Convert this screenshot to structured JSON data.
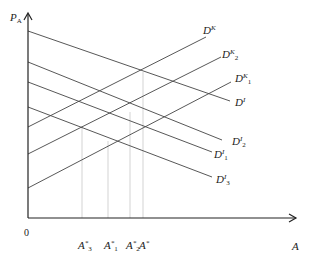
{
  "axes": {
    "y_label": {
      "base": "P",
      "sub": "A"
    },
    "x_label": "A",
    "origin": "0"
  },
  "curves": [
    {
      "id": "DI",
      "base": "D",
      "sup": "I",
      "sub": "",
      "x1": 28,
      "y1": 31,
      "x2": 230,
      "y2": 101,
      "lx": 235,
      "ly": 97
    },
    {
      "id": "DI2",
      "base": "D",
      "sup": "I",
      "sub": "2",
      "x1": 28,
      "y1": 62,
      "x2": 222,
      "y2": 140,
      "lx": 232,
      "ly": 136
    },
    {
      "id": "DI1",
      "base": "D",
      "sup": "I",
      "sub": "1",
      "x1": 28,
      "y1": 82,
      "x2": 212,
      "y2": 152,
      "lx": 214,
      "ly": 149
    },
    {
      "id": "DI3",
      "base": "D",
      "sup": "I",
      "sub": "3",
      "x1": 28,
      "y1": 107,
      "x2": 212,
      "y2": 177,
      "lx": 216,
      "ly": 174
    },
    {
      "id": "DK",
      "base": "D",
      "sup": "K",
      "sub": "",
      "x1": 28,
      "y1": 127,
      "x2": 206,
      "y2": 37,
      "lx": 203,
      "ly": 25
    },
    {
      "id": "DK2",
      "base": "D",
      "sup": "K",
      "sub": "2",
      "x1": 28,
      "y1": 154,
      "x2": 221,
      "y2": 57,
      "lx": 222,
      "ly": 49
    },
    {
      "id": "DK1",
      "base": "D",
      "sup": "K",
      "sub": "1",
      "x1": 28,
      "y1": 188,
      "x2": 231,
      "y2": 82,
      "lx": 235,
      "ly": 73
    }
  ],
  "equilibria": [
    {
      "label_base": "A",
      "sup": "*",
      "sub": "3",
      "x": 82,
      "y_top": 126
    },
    {
      "label_base": "A",
      "sup": "*",
      "sub": "1",
      "x": 108,
      "y_top": 141
    },
    {
      "label_base": "A",
      "sup": "*",
      "sub": "2",
      "x": 130,
      "y_top": 112
    },
    {
      "label_base": "A",
      "sup": "*",
      "sub": "",
      "x": 143,
      "y_top": 72
    }
  ]
}
